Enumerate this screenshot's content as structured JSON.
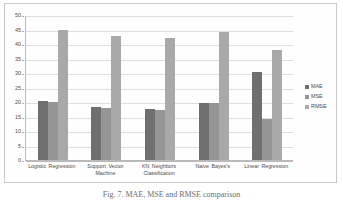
{
  "chart_data": {
    "type": "bar",
    "title": "",
    "xlabel": "",
    "ylabel": "",
    "ylim": [
      0,
      50
    ],
    "yticks": [
      0,
      5,
      10,
      15,
      20,
      25,
      30,
      35,
      40,
      45,
      50
    ],
    "grid": true,
    "legend_position": "right",
    "categories": [
      "Logistic Regression",
      "Support Vector Machine",
      "KN Neighbors Classification",
      "Naive Bayes's",
      "Linear Regression"
    ],
    "series": [
      {
        "name": "MAE",
        "color": "#6f6f6f",
        "values": [
          20.3,
          18.2,
          17.5,
          19.6,
          30.5
        ]
      },
      {
        "name": "MSE",
        "color": "#959595",
        "values": [
          20.1,
          18.1,
          17.4,
          19.5,
          14.0
        ]
      },
      {
        "name": "RMSE",
        "color": "#a9a9a9",
        "values": [
          45.0,
          42.7,
          42.0,
          44.2,
          37.9
        ]
      }
    ]
  },
  "legend": {
    "items": [
      {
        "label": "MAE",
        "color": "#6f6f6f"
      },
      {
        "label": "MSE",
        "color": "#959595"
      },
      {
        "label": "RMSE",
        "color": "#a9a9a9"
      }
    ]
  },
  "caption": {
    "text": "Fig. 7. MAE, MSE and RMSE comparison"
  }
}
